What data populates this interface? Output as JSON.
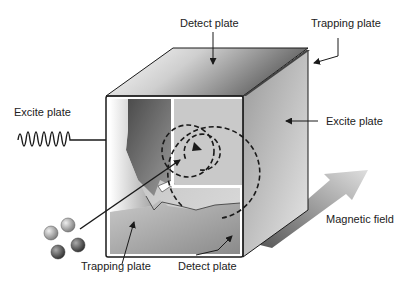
{
  "diagram": {
    "labels": {
      "detect_plate_top": "Detect plate",
      "trapping_plate_top": "Trapping plate",
      "excite_plate_left": "Excite plate",
      "excite_plate_right": "Excite plate",
      "magnetic_field": "Magnetic field",
      "trapping_plate_bottom": "Trapping plate",
      "detect_plate_bottom": "Detect plate"
    },
    "colors": {
      "outline": "#1a1a1a",
      "face_light": "#f2f2f2",
      "face_dark": "#5a5a5a",
      "arrow_light": "#d8d8d8",
      "arrow_dark": "#5f5f5f"
    },
    "ions": 4
  }
}
